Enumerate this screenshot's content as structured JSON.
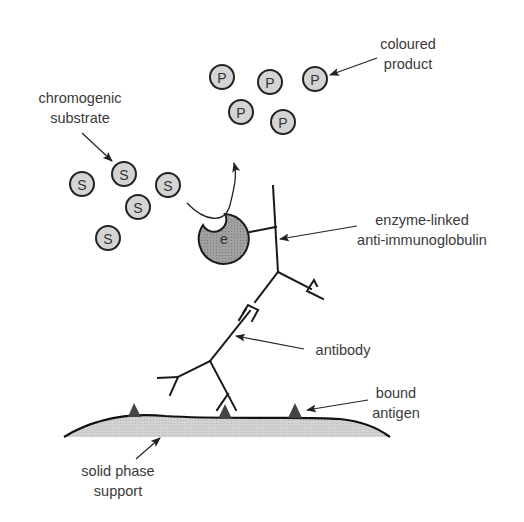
{
  "diagram": {
    "labels": {
      "chromogenic_substrate": {
        "line1": "chromogenic",
        "line2": "substrate"
      },
      "coloured_product": {
        "line1": "coloured",
        "line2": "product"
      },
      "enzyme_linked": {
        "line1": "enzyme-linked",
        "line2": "anti-immunoglobulin"
      },
      "antibody": {
        "line1": "antibody"
      },
      "bound_antigen": {
        "line1": "bound",
        "line2": "antigen"
      },
      "solid_phase": {
        "line1": "solid phase",
        "line2": "support"
      }
    },
    "substrate_glyph": "S",
    "product_glyph": "P",
    "enzyme_glyph": "e",
    "substrate_count": 5,
    "product_count": 5,
    "antigen_count": 3,
    "colors": {
      "molecule_fill": "#d4d4d4",
      "enzyme_fill": "#9a9a9a",
      "support_fill": "#cfcfcf",
      "antigen_fill": "#4a4a4a",
      "stroke": "#222222",
      "text": "#3a3a3a"
    }
  }
}
